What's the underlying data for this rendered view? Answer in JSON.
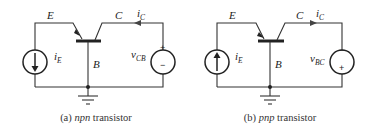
{
  "figures": [
    {
      "id": "a",
      "caption_prefix": "(a) ",
      "caption_type": "npn",
      "caption_suffix": " transistor",
      "labels": {
        "emitter": "E",
        "collector": "C",
        "base": "B",
        "ie_main": "i",
        "ie_sub": "E",
        "ic_main": "i",
        "ic_sub": "C",
        "v_main": "v",
        "v_sub": "CB",
        "plus": "+",
        "minus": "−"
      },
      "current_source_arrow": "down",
      "collector_arrow": "left",
      "emitter_arrow": "out-of-base"
    },
    {
      "id": "b",
      "caption_prefix": "(b) ",
      "caption_type": "pnp",
      "caption_suffix": " transistor",
      "labels": {
        "emitter": "E",
        "collector": "C",
        "base": "B",
        "ie_main": "i",
        "ie_sub": "E",
        "ic_main": "i",
        "ic_sub": "C",
        "v_main": "v",
        "v_sub": "BC",
        "plus": "+",
        "minus": "−"
      },
      "current_source_arrow": "up",
      "collector_arrow": "right",
      "emitter_arrow": "into-base"
    }
  ]
}
